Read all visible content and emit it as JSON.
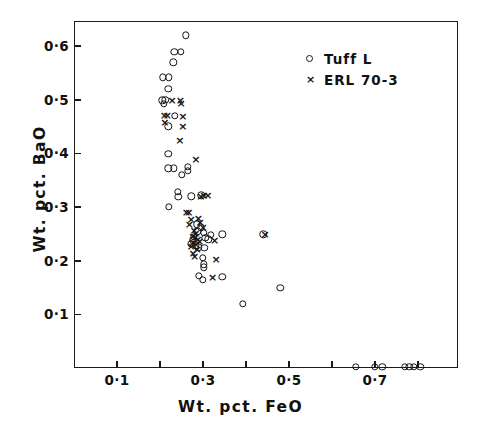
{
  "chart_data": {
    "type": "scatter",
    "title": "",
    "xlabel": "Wt. pct. FeO",
    "ylabel": "Wt. pct. BaO",
    "xlim": [
      0.0,
      0.893
    ],
    "ylim": [
      0.0,
      0.647
    ],
    "grid": false,
    "legend_position": "top-right",
    "x_ticks": [
      {
        "value": 0.1,
        "label": "0·1",
        "labeled": true
      },
      {
        "value": 0.2,
        "label": "",
        "labeled": false
      },
      {
        "value": 0.3,
        "label": "0·3",
        "labeled": true
      },
      {
        "value": 0.4,
        "label": "",
        "labeled": false
      },
      {
        "value": 0.5,
        "label": "0·5",
        "labeled": true
      },
      {
        "value": 0.6,
        "label": "",
        "labeled": false
      },
      {
        "value": 0.7,
        "label": "0·7",
        "labeled": true
      },
      {
        "value": 0.8,
        "label": "",
        "labeled": false
      }
    ],
    "y_ticks": [
      {
        "value": 0.1,
        "label": "0·1",
        "labeled": true
      },
      {
        "value": 0.2,
        "label": "0·2",
        "labeled": true
      },
      {
        "value": 0.3,
        "label": "0·3",
        "labeled": true
      },
      {
        "value": 0.4,
        "label": "0·4",
        "labeled": true
      },
      {
        "value": 0.5,
        "label": "0·5",
        "labeled": true
      },
      {
        "value": 0.6,
        "label": "0·6",
        "labeled": true
      }
    ],
    "series": [
      {
        "name": "Tuff L",
        "marker": "circle",
        "points": [
          [
            0.26,
            0.62
          ],
          [
            0.233,
            0.59
          ],
          [
            0.248,
            0.59
          ],
          [
            0.231,
            0.57
          ],
          [
            0.207,
            0.542
          ],
          [
            0.221,
            0.542
          ],
          [
            0.219,
            0.521
          ],
          [
            0.205,
            0.499
          ],
          [
            0.212,
            0.5
          ],
          [
            0.209,
            0.493
          ],
          [
            0.234,
            0.47
          ],
          [
            0.219,
            0.451
          ],
          [
            0.219,
            0.399
          ],
          [
            0.219,
            0.372
          ],
          [
            0.232,
            0.372
          ],
          [
            0.264,
            0.375
          ],
          [
            0.265,
            0.368
          ],
          [
            0.251,
            0.36
          ],
          [
            0.241,
            0.328
          ],
          [
            0.243,
            0.319
          ],
          [
            0.221,
            0.3
          ],
          [
            0.273,
            0.32
          ],
          [
            0.296,
            0.322
          ],
          [
            0.286,
            0.268
          ],
          [
            0.287,
            0.255
          ],
          [
            0.295,
            0.262
          ],
          [
            0.302,
            0.252
          ],
          [
            0.305,
            0.243
          ],
          [
            0.312,
            0.24
          ],
          [
            0.318,
            0.248
          ],
          [
            0.278,
            0.245
          ],
          [
            0.276,
            0.238
          ],
          [
            0.272,
            0.232
          ],
          [
            0.283,
            0.229
          ],
          [
            0.289,
            0.225
          ],
          [
            0.303,
            0.224
          ],
          [
            0.3,
            0.205
          ],
          [
            0.302,
            0.193
          ],
          [
            0.302,
            0.188
          ],
          [
            0.345,
            0.249
          ],
          [
            0.44,
            0.249
          ],
          [
            0.29,
            0.172
          ],
          [
            0.299,
            0.164
          ],
          [
            0.345,
            0.17
          ],
          [
            0.48,
            0.149
          ],
          [
            0.392,
            0.12
          ],
          [
            0.655,
            0.002
          ],
          [
            0.7,
            0.002
          ],
          [
            0.717,
            0.002
          ],
          [
            0.77,
            0.002
          ],
          [
            0.78,
            0.002
          ],
          [
            0.79,
            0.002
          ],
          [
            0.805,
            0.002
          ]
        ]
      },
      {
        "name": "ERL 70-3",
        "marker": "x",
        "points": [
          [
            0.228,
            0.499
          ],
          [
            0.247,
            0.5
          ],
          [
            0.249,
            0.495
          ],
          [
            0.21,
            0.472
          ],
          [
            0.217,
            0.472
          ],
          [
            0.253,
            0.47
          ],
          [
            0.211,
            0.458
          ],
          [
            0.253,
            0.451
          ],
          [
            0.246,
            0.426
          ],
          [
            0.283,
            0.389
          ],
          [
            0.295,
            0.32
          ],
          [
            0.302,
            0.322
          ],
          [
            0.311,
            0.322
          ],
          [
            0.261,
            0.29
          ],
          [
            0.267,
            0.29
          ],
          [
            0.272,
            0.277
          ],
          [
            0.289,
            0.279
          ],
          [
            0.293,
            0.272
          ],
          [
            0.268,
            0.268
          ],
          [
            0.3,
            0.263
          ],
          [
            0.279,
            0.257
          ],
          [
            0.283,
            0.252
          ],
          [
            0.276,
            0.246
          ],
          [
            0.281,
            0.244
          ],
          [
            0.288,
            0.241
          ],
          [
            0.292,
            0.236
          ],
          [
            0.276,
            0.235
          ],
          [
            0.283,
            0.232
          ],
          [
            0.272,
            0.227
          ],
          [
            0.286,
            0.222
          ],
          [
            0.277,
            0.215
          ],
          [
            0.28,
            0.208
          ],
          [
            0.327,
            0.238
          ],
          [
            0.33,
            0.203
          ],
          [
            0.322,
            0.17
          ],
          [
            0.444,
            0.249
          ]
        ]
      }
    ]
  },
  "legend": {
    "entries": [
      {
        "marker": "circle",
        "label": "Tuff L"
      },
      {
        "marker": "x",
        "label": "ERL 70-3"
      }
    ]
  },
  "markers": {
    "cross_glyph": "×"
  }
}
